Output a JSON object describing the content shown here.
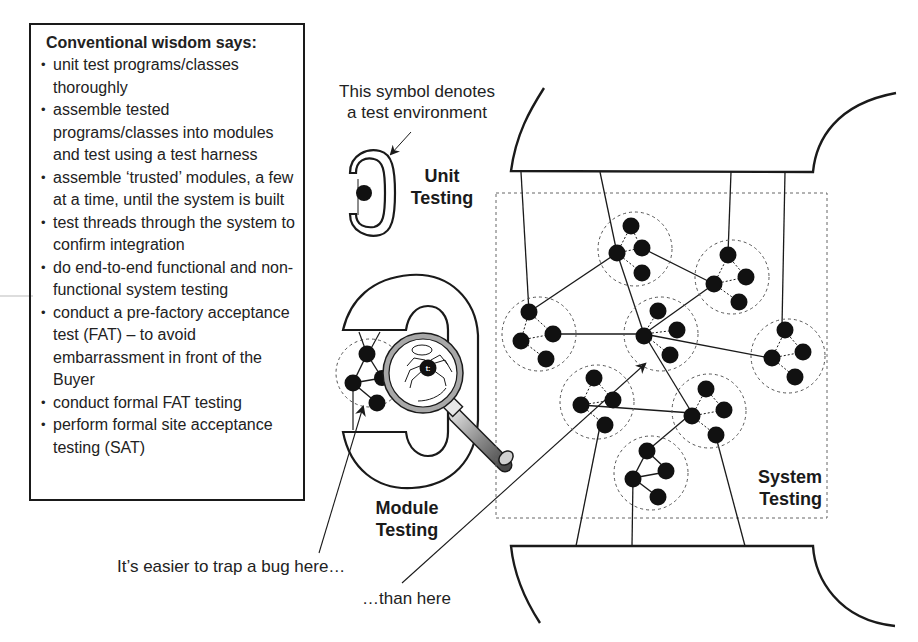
{
  "wisdom_box": {
    "title": "Conventional wisdom says:",
    "items": [
      "unit test programs/classes thoroughly",
      "assemble tested programs/classes into modules and test using a test harness",
      "assemble ‘trusted’ modules, a few at a time, until the system is built",
      "test threads through the system to confirm integration",
      "do end-to-end functional and non-functional system testing",
      "conduct a pre-factory acceptance test (FAT) – to avoid embarrassment in front of the Buyer",
      "conduct formal FAT testing",
      "perform formal site acceptance testing (SAT)"
    ]
  },
  "annotations": {
    "symbol_note_line1": "This symbol denotes",
    "symbol_note_line2": "a test environment",
    "unit_testing_line1": "Unit",
    "unit_testing_line2": "Testing",
    "module_testing_line1": "Module",
    "module_testing_line2": "Testing",
    "system_testing_line1": "System",
    "system_testing_line2": "Testing",
    "easier_here": "It’s easier to trap a bug here…",
    "than_here": "…than here"
  },
  "icons": {
    "unit_symbol": "test-environment-clamp-icon",
    "module_symbol": "module-test-harness-icon",
    "magnifier": "magnifying-glass-icon",
    "bug": "spider-bug-icon"
  },
  "colors": {
    "ink": "#1a1a1a",
    "dashed": "#555555",
    "lens_rim": "#9a9a9a",
    "handle": "#7a7a7a",
    "background": "#ffffff"
  }
}
